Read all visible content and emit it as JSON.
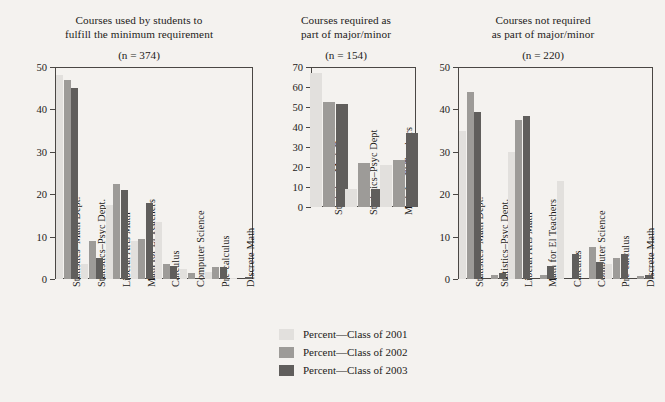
{
  "figure": {
    "legend": {
      "items": [
        {
          "label": "Percent—Class of 2001",
          "color": "#e2e0dd"
        },
        {
          "label": "Percent—Class of 2002",
          "color": "#9d9b98"
        },
        {
          "label": "Percent—Class of 2003",
          "color": "#605e5c"
        }
      ]
    }
  },
  "chart_data": [
    {
      "type": "bar",
      "title": "Courses used by students to fulfill the minimum requirement",
      "title_line1": "Courses used by students to",
      "title_line2": "fulfill the minimum requirement",
      "subtitle": "(n = 374)",
      "n": 374,
      "xlabel": "",
      "ylabel": "",
      "ylim": [
        0,
        50
      ],
      "yticks": [
        0,
        10,
        20,
        30,
        40,
        50
      ],
      "grid": false,
      "legend_position": "bottom-center",
      "categories": [
        "Statistics–Math Dept.",
        "Statistics–Psyc Dept.",
        "Liberal Arts Math",
        "Math for El Teachers",
        "Calculus",
        "Computer Science",
        "Pre-calculus",
        "Discrete Math"
      ],
      "series": [
        {
          "name": "Percent—Class of 2001",
          "values": [
            48,
            3.5,
            17.5,
            9,
            13.5,
            2.3,
            1.6,
            0.3
          ]
        },
        {
          "name": "Percent—Class of 2002",
          "values": [
            47,
            9,
            22.5,
            9.5,
            3.6,
            1.4,
            2.9,
            0
          ]
        },
        {
          "name": "Percent—Class of 2003",
          "values": [
            45,
            5,
            21,
            18,
            3.1,
            0,
            2.9,
            0.4
          ]
        }
      ]
    },
    {
      "type": "bar",
      "title": "Courses required as part of major/minor",
      "title_line1": "Courses required as",
      "title_line2": "part of major/minor",
      "subtitle": "(n = 154)",
      "n": 154,
      "xlabel": "",
      "ylabel": "",
      "ylim": [
        0,
        70
      ],
      "yticks": [
        0,
        10,
        20,
        30,
        40,
        50,
        60,
        70
      ],
      "grid": false,
      "legend_position": "bottom-center",
      "categories": [
        "Statistics–Math Dept.",
        "Statistics–Psyc Dept",
        "Math for El Teachers"
      ],
      "series": [
        {
          "name": "Percent—Class of 2001",
          "values": [
            67,
            9,
            21
          ]
        },
        {
          "name": "Percent—Class of 2002",
          "values": [
            52.5,
            22,
            23.5
          ]
        },
        {
          "name": "Percent—Class of 2003",
          "values": [
            51.5,
            9,
            37
          ]
        }
      ]
    },
    {
      "type": "bar",
      "title": "Courses not required as part of major/minor",
      "title_line1": "Courses not required",
      "title_line2": "as part of major/minor",
      "subtitle": "(n = 220)",
      "n": 220,
      "xlabel": "",
      "ylabel": "",
      "ylim": [
        0,
        50
      ],
      "yticks": [
        0,
        10,
        20,
        30,
        40,
        50
      ],
      "grid": false,
      "legend_position": "bottom-center",
      "categories": [
        "Statistics–Math Dept.",
        "Statistics–Psyc Dept.",
        "Liberal Arts Math",
        "Math for El Teachers",
        "Calculus",
        "Computer Science",
        "Pre-calculus",
        "Discrete Math"
      ],
      "series": [
        {
          "name": "Percent—Class of 2001",
          "values": [
            35,
            0,
            30,
            0,
            23,
            0,
            3.5,
            0
          ]
        },
        {
          "name": "Percent—Class of 2002",
          "values": [
            44,
            1,
            37.5,
            1,
            0,
            7.5,
            5,
            0.7
          ]
        },
        {
          "name": "Percent—Class of 2003",
          "values": [
            39.5,
            1.5,
            38.5,
            3,
            6,
            4,
            6,
            1
          ]
        }
      ]
    }
  ]
}
